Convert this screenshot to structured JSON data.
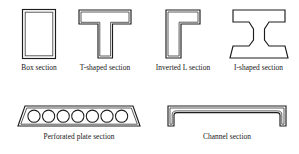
{
  "figure": {
    "background_color": "#ffffff",
    "line_color": "#1c1c1c",
    "rows": [
      {
        "name": "row-1",
        "items": [
          {
            "key": "box",
            "label": "Box section",
            "shape": "hollow-rectangle"
          },
          {
            "key": "tee",
            "label": "T-shaped section",
            "shape": "tee-outline"
          },
          {
            "key": "inverted-l",
            "label": "Inverted L section",
            "shape": "inverted-l-outline"
          },
          {
            "key": "i-shape",
            "label": "I-shaped section",
            "shape": "i-beam-outline"
          }
        ]
      },
      {
        "name": "row-2",
        "items": [
          {
            "key": "perforated",
            "label": "Perforated plate section",
            "shape": "trapezoid-with-holes",
            "hole_count": 7
          },
          {
            "key": "channel",
            "label": "Channel section",
            "shape": "inverted-u-outline"
          }
        ]
      }
    ]
  }
}
